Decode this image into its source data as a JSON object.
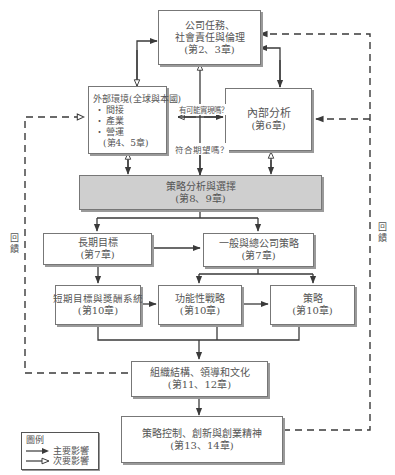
{
  "diagram": {
    "nodes": {
      "mission": {
        "lines": [
          "公司任務、",
          "社會責任與倫理",
          "(第2、3章)"
        ]
      },
      "external": {
        "title": "外部環境(全球與本國)",
        "bullets": [
          "間接",
          "產業",
          "營運"
        ],
        "chapter": "(第4、5章)"
      },
      "internal": {
        "lines": [
          "內部分析",
          "(第6章)"
        ]
      },
      "strategic_analysis": {
        "lines": [
          "策略分析與選擇",
          "(第8、9章)"
        ]
      },
      "long_term": {
        "lines": [
          "長期目標",
          "(第7章)"
        ]
      },
      "generic": {
        "lines": [
          "一般與總公司策略",
          "(第7章)"
        ]
      },
      "short_term": {
        "lines": [
          "短期目標與獎酬系統",
          "(第10章)"
        ]
      },
      "functional": {
        "lines": [
          "功能性戰略",
          "(第10章)"
        ]
      },
      "policies": {
        "lines": [
          "策略",
          "(第10章)"
        ]
      },
      "structure": {
        "lines": [
          "組織結構、領導和文化",
          "(第11、12章)"
        ]
      },
      "control": {
        "lines": [
          "策略控制、創新與創業精神",
          "(第13、14章)"
        ]
      }
    },
    "edge_labels": {
      "possible": "有可能實現嗎？",
      "desired": "符合期望嗎？"
    },
    "feedback_left": [
      "回",
      "饋"
    ],
    "feedback_right": [
      "回",
      "饋"
    ],
    "legend": {
      "title": "圖例",
      "primary": "主要影響",
      "secondary": "次要影響"
    }
  },
  "colors": {
    "line": "#3a3a3a",
    "box_border": "#777777",
    "shaded_fill": "#cfcfcf",
    "text": "#555555"
  }
}
